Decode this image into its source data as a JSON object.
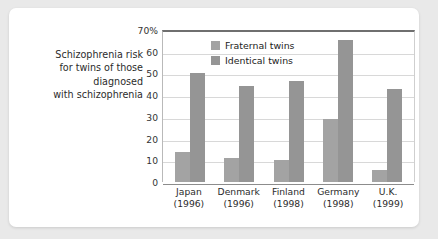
{
  "caption": {
    "lines": [
      "Schizophrenia risk",
      "for twins of those",
      "diagnosed",
      "with schizophrenia"
    ]
  },
  "chart_data": {
    "type": "bar",
    "title": "",
    "xlabel": "",
    "ylabel": "",
    "ylim": [
      0,
      70
    ],
    "yticks": [
      0,
      10,
      20,
      30,
      40,
      50,
      60,
      70
    ],
    "ytick_labels": [
      "0",
      "10",
      "20",
      "30",
      "40",
      "50",
      "60",
      "70%"
    ],
    "grid": true,
    "legend_position": "top-left",
    "categories": [
      "Japan",
      "Denmark",
      "Finland",
      "Germany",
      "U.K."
    ],
    "category_years": [
      "(1996)",
      "(1996)",
      "(1998)",
      "(1998)",
      "(1999)"
    ],
    "series": [
      {
        "name": "Fraternal twins",
        "color": "#a3a3a3",
        "values": [
          14,
          11,
          10,
          29,
          5.5
        ]
      },
      {
        "name": "Identical twins",
        "color": "#959595",
        "values": [
          50,
          44,
          46.5,
          65.5,
          43
        ]
      }
    ]
  }
}
